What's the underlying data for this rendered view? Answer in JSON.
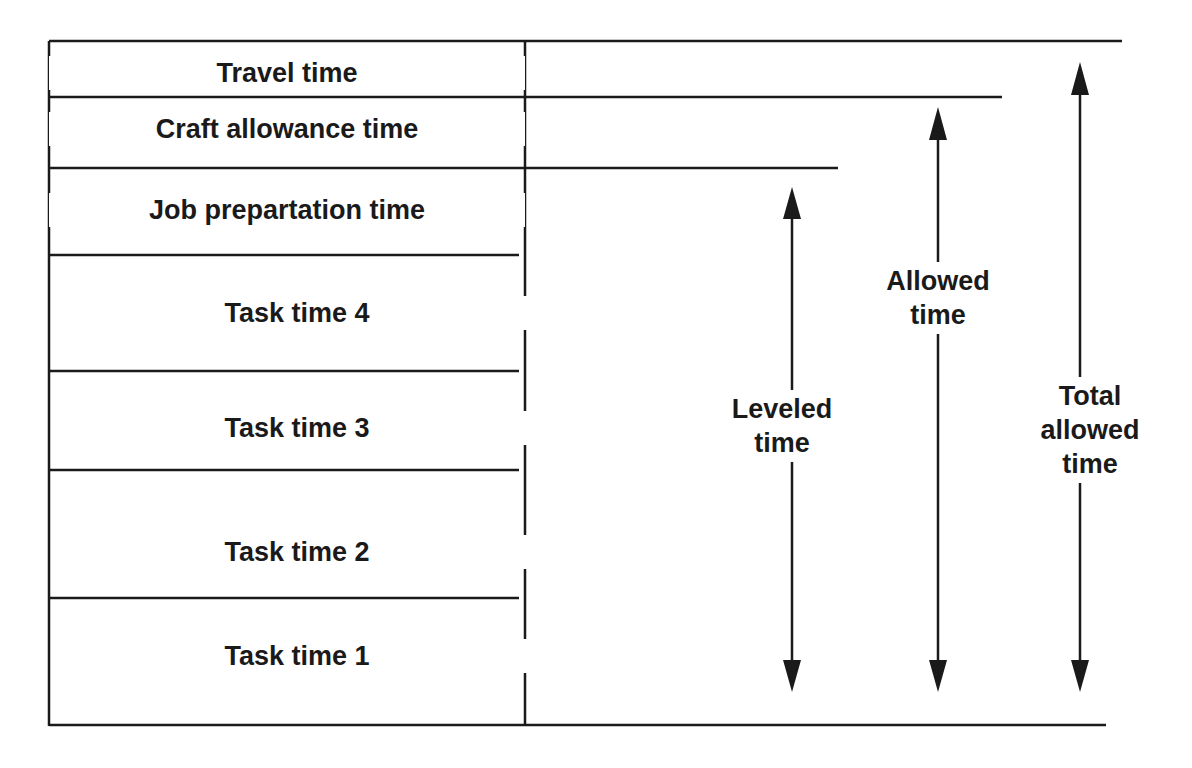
{
  "diagram": {
    "rows": [
      {
        "label": "Travel time"
      },
      {
        "label": "Craft allowance time"
      },
      {
        "label": "Job prepartation time"
      },
      {
        "label": "Task time 4"
      },
      {
        "label": "Task time 3"
      },
      {
        "label": "Task time 2"
      },
      {
        "label": "Task time 1"
      }
    ],
    "arrows": [
      {
        "line1": "Leveled",
        "line2": "time"
      },
      {
        "line1": "Allowed",
        "line2": "time"
      },
      {
        "line1": "Total",
        "line2": "allowed",
        "line3": "time"
      }
    ],
    "colors": {
      "line": "#1a1a1a",
      "background": "#ffffff"
    }
  }
}
